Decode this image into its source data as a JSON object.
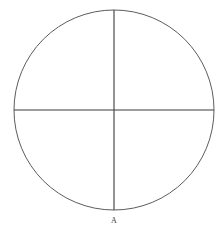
{
  "figure": {
    "background_color": "#ffffff",
    "canvas": {
      "width": 222,
      "height": 236
    },
    "circle": {
      "center_x": 114,
      "center_y": 110,
      "radius": 100,
      "stroke_color": "#4a4a4a",
      "stroke_width": 0.9,
      "fill": "none"
    },
    "vertical_diameter": {
      "x1": 114,
      "y1": 10,
      "x2": 114,
      "y2": 210,
      "stroke_color": "#3c3c3c",
      "stroke_width": 1.1
    },
    "horizontal_diameter": {
      "x1": 14,
      "y1": 110,
      "x2": 214,
      "y2": 110,
      "stroke_color": "#3c3c3c",
      "stroke_width": 1.1
    },
    "labels": [
      {
        "text": "A",
        "x": 114,
        "y": 217,
        "color": "#3a3a3a",
        "font_size": 8
      }
    ]
  }
}
